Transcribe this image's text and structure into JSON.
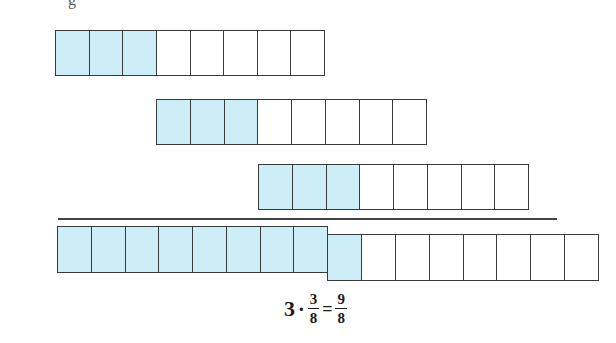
{
  "caption_fragment": "g",
  "colors": {
    "fill": "#cdeef6",
    "empty": "#ffffff",
    "stroke": "#3a3a3a"
  },
  "rows": [
    {
      "label": "3/8 (first)",
      "total_parts": 8,
      "filled_parts": 3
    },
    {
      "label": "3/8 (second)",
      "total_parts": 8,
      "filled_parts": 3
    },
    {
      "label": "3/8 (third)",
      "total_parts": 8,
      "filled_parts": 3
    }
  ],
  "result": {
    "whole_bar": {
      "total_parts": 8,
      "filled_parts": 8
    },
    "partial_bar": {
      "total_parts": 8,
      "filled_parts": 1
    }
  },
  "formula": {
    "multiplier": "3",
    "operator": "·",
    "fraction_numerator": "3",
    "fraction_denominator": "8",
    "equals": "=",
    "result_numerator": "9",
    "result_denominator": "8"
  }
}
